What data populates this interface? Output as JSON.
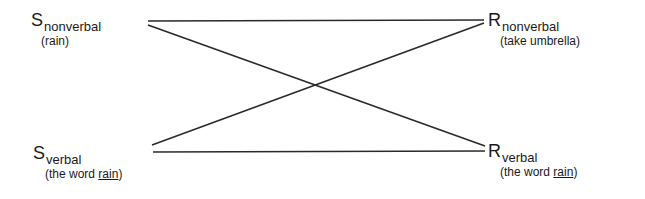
{
  "diagram": {
    "nodes": [
      {
        "id": "s_nonverbal",
        "symbol": "S",
        "subscript": "nonverbal",
        "gloss": "(rain)"
      },
      {
        "id": "r_nonverbal",
        "symbol": "R",
        "subscript": "nonverbal",
        "gloss": "(take umbrella)"
      },
      {
        "id": "s_verbal",
        "symbol": "S",
        "subscript": "verbal",
        "gloss_prefix": "(the word ",
        "gloss_underlined": "rain",
        "gloss_suffix": ")"
      },
      {
        "id": "r_verbal",
        "symbol": "R",
        "subscript": "verbal",
        "gloss_prefix": "(the word ",
        "gloss_underlined": "rain",
        "gloss_suffix": ")"
      }
    ],
    "edges": [
      {
        "from": "s_nonverbal",
        "to": "r_nonverbal"
      },
      {
        "from": "s_nonverbal",
        "to": "r_verbal"
      },
      {
        "from": "s_verbal",
        "to": "r_nonverbal"
      },
      {
        "from": "s_verbal",
        "to": "r_verbal"
      }
    ],
    "line_color": "#2a2a2a"
  }
}
